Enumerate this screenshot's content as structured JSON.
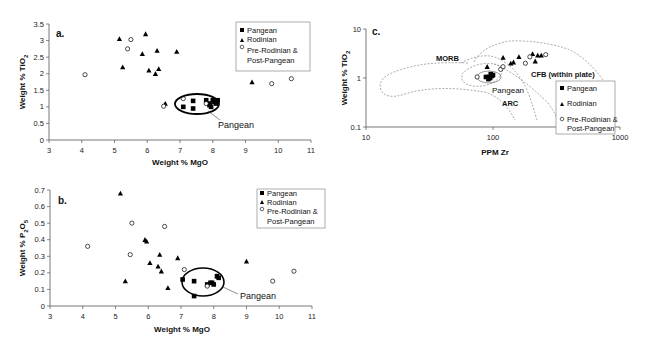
{
  "chart_data": [
    {
      "panel": "a.",
      "type": "scatter",
      "title": "",
      "xlabel": "Weight % MgO",
      "ylabel": "Weight % TiO2",
      "xlim": [
        3,
        11
      ],
      "ylim": [
        0,
        3.5
      ],
      "xticks": [
        "3",
        "4",
        "5",
        "6",
        "7",
        "8",
        "9",
        "10",
        "11"
      ],
      "yticks": [
        "0",
        "0.5",
        "1",
        "1.5",
        "2",
        "2.5",
        "3",
        "3.5"
      ],
      "grid": false,
      "legend": [
        "Pangean",
        "Rodinian",
        "Pre-Rodinian &",
        "Post-Pangean"
      ],
      "legend_position": "upper right",
      "annotation": "Pangean",
      "series": [
        {
          "name": "Pangean",
          "marker": "square",
          "points": [
            [
              7.1,
              1.0
            ],
            [
              7.4,
              0.95
            ],
            [
              7.4,
              1.18
            ],
            [
              7.8,
              1.2
            ],
            [
              7.9,
              1.1
            ],
            [
              7.9,
              1.05
            ],
            [
              8.0,
              1.2
            ],
            [
              8.05,
              1.15
            ],
            [
              8.1,
              1.1
            ],
            [
              8.15,
              1.2
            ],
            [
              7.95,
              1.0
            ]
          ]
        },
        {
          "name": "Rodinian",
          "marker": "triangle",
          "points": [
            [
              5.15,
              3.05
            ],
            [
              5.25,
              2.2
            ],
            [
              5.85,
              2.6
            ],
            [
              5.95,
              3.2
            ],
            [
              6.05,
              2.1
            ],
            [
              6.25,
              2.0
            ],
            [
              6.3,
              2.7
            ],
            [
              6.35,
              2.15
            ],
            [
              6.9,
              2.67
            ],
            [
              6.55,
              1.1
            ],
            [
              9.2,
              1.75
            ]
          ]
        },
        {
          "name": "Pre-Rodinian & Post-Pangean",
          "marker": "circle",
          "points": [
            [
              4.1,
              1.97
            ],
            [
              5.4,
              2.75
            ],
            [
              5.5,
              3.03
            ],
            [
              6.5,
              1.02
            ],
            [
              7.1,
              1.25
            ],
            [
              7.8,
              1.1
            ],
            [
              9.8,
              1.7
            ],
            [
              10.4,
              1.85
            ]
          ]
        }
      ]
    },
    {
      "panel": "b.",
      "type": "scatter",
      "title": "",
      "xlabel": "Weight % MgO",
      "ylabel": "Weight % P2O5",
      "xlim": [
        3,
        11
      ],
      "ylim": [
        0,
        0.7
      ],
      "xticks": [
        "3",
        "4",
        "5",
        "6",
        "7",
        "8",
        "9",
        "10",
        "11"
      ],
      "yticks": [
        "0",
        "0.1",
        "0.2",
        "0.3",
        "0.4",
        "0.5",
        "0.6",
        "0.7"
      ],
      "grid": false,
      "legend": [
        "Pangean",
        "Rodinian",
        "Pre-Rodinian &",
        "Post-Pangean"
      ],
      "legend_position": "upper right",
      "annotation": "Pangean",
      "series": [
        {
          "name": "Pangean",
          "marker": "square",
          "points": [
            [
              7.05,
              0.16
            ],
            [
              7.4,
              0.15
            ],
            [
              7.4,
              0.06
            ],
            [
              7.8,
              0.13
            ],
            [
              7.9,
              0.14
            ],
            [
              7.95,
              0.14
            ],
            [
              8.0,
              0.13
            ],
            [
              8.1,
              0.18
            ],
            [
              8.15,
              0.17
            ]
          ]
        },
        {
          "name": "Rodinian",
          "marker": "triangle",
          "points": [
            [
              5.15,
              0.68
            ],
            [
              5.3,
              0.15
            ],
            [
              5.9,
              0.4
            ],
            [
              5.95,
              0.39
            ],
            [
              6.05,
              0.26
            ],
            [
              6.3,
              0.24
            ],
            [
              6.35,
              0.31
            ],
            [
              6.4,
              0.21
            ],
            [
              6.6,
              0.11
            ],
            [
              6.9,
              0.29
            ],
            [
              8.1,
              0.18
            ],
            [
              9.0,
              0.27
            ]
          ]
        },
        {
          "name": "Pre-Rodinian & Post-Pangean",
          "marker": "circle",
          "points": [
            [
              4.15,
              0.36
            ],
            [
              5.45,
              0.31
            ],
            [
              5.5,
              0.5
            ],
            [
              6.5,
              0.48
            ],
            [
              7.1,
              0.22
            ],
            [
              7.8,
              0.12
            ],
            [
              9.8,
              0.15
            ],
            [
              10.45,
              0.21
            ]
          ]
        }
      ]
    },
    {
      "panel": "c.",
      "type": "scatter",
      "title": "",
      "xlabel": "PPM Zr",
      "ylabel": "Weight % TiO2",
      "xscale": "log",
      "yscale": "log",
      "xlim": [
        10,
        1000
      ],
      "ylim": [
        0.1,
        10
      ],
      "xticks": [
        "10",
        "100",
        "1000"
      ],
      "yticks": [
        "0.1",
        "1",
        "10"
      ],
      "grid": false,
      "legend": [
        "Pangean",
        "Rodinian",
        "Pre-Rodinian &",
        "Post-Pangean"
      ],
      "legend_position": "lower right",
      "field_labels": [
        "MORB",
        "CFB (within plate)",
        "ARC",
        "Pangean"
      ],
      "series": [
        {
          "name": "Pangean",
          "marker": "square",
          "points": [
            [
              88,
              1.05
            ],
            [
              92,
              0.95
            ],
            [
              95,
              1.0
            ],
            [
              98,
              1.1
            ],
            [
              100,
              1.15
            ],
            [
              96,
              1.2
            ],
            [
              93,
              1.05
            ]
          ]
        },
        {
          "name": "Rodinian",
          "marker": "triangle",
          "points": [
            [
              90,
              1.7
            ],
            [
              120,
              2.6
            ],
            [
              138,
              2.0
            ],
            [
              145,
              2.1
            ],
            [
              160,
              2.7
            ],
            [
              205,
              3.1
            ],
            [
              215,
              2.2
            ],
            [
              225,
              2.9
            ],
            [
              240,
              2.9
            ]
          ]
        },
        {
          "name": "Pre-Rodinian & Post-Pangean",
          "marker": "circle",
          "points": [
            [
              75,
              1.05
            ],
            [
              115,
              1.5
            ],
            [
              120,
              1.7
            ],
            [
              180,
              2.0
            ],
            [
              195,
              2.7
            ],
            [
              260,
              3.0
            ]
          ]
        }
      ]
    }
  ],
  "labels": {
    "a": {
      "panel": "a.",
      "xlabel": "Weight % MgO",
      "ylabel_main": "Weight % TiO",
      "ylabel_sub": "2",
      "annotation": "Pangean",
      "legend": [
        "Pangean",
        "Rodinian",
        "Pre-Rodinian &",
        "Post-Pangean"
      ],
      "xticks": [
        "3",
        "4",
        "5",
        "6",
        "7",
        "8",
        "9",
        "10",
        "11"
      ],
      "yticks": [
        "0",
        "0.5",
        "1",
        "1.5",
        "2",
        "2.5",
        "3",
        "3.5"
      ]
    },
    "b": {
      "panel": "b.",
      "xlabel": "Weight % MgO",
      "ylabel_main": "Weight % P",
      "ylabel_sub1": "2",
      "ylabel_mid": "O",
      "ylabel_sub2": "5",
      "annotation": "Pangean",
      "legend": [
        "Pangean",
        "Rodinian",
        "Pre-Rodinian &",
        "Post-Pangean"
      ],
      "xticks": [
        "3",
        "4",
        "5",
        "6",
        "7",
        "8",
        "9",
        "10",
        "11"
      ],
      "yticks": [
        "0",
        "0.1",
        "0.2",
        "0.3",
        "0.4",
        "0.5",
        "0.6",
        "0.7"
      ]
    },
    "c": {
      "panel": "c.",
      "xlabel": "PPM Zr",
      "ylabel_main": "Weight % TiO",
      "ylabel_sub": "2",
      "legend": [
        "Pangean",
        "Rodinian",
        "Pre-Rodinian &",
        "Post-Pangean"
      ],
      "fields": {
        "morb": "MORB",
        "cfb": "CFB (within plate)",
        "arc": "ARC",
        "pangean": "Pangean"
      },
      "xticks": [
        "10",
        "100",
        "1000"
      ],
      "yticks": [
        "10",
        "1",
        "0.1"
      ]
    }
  }
}
